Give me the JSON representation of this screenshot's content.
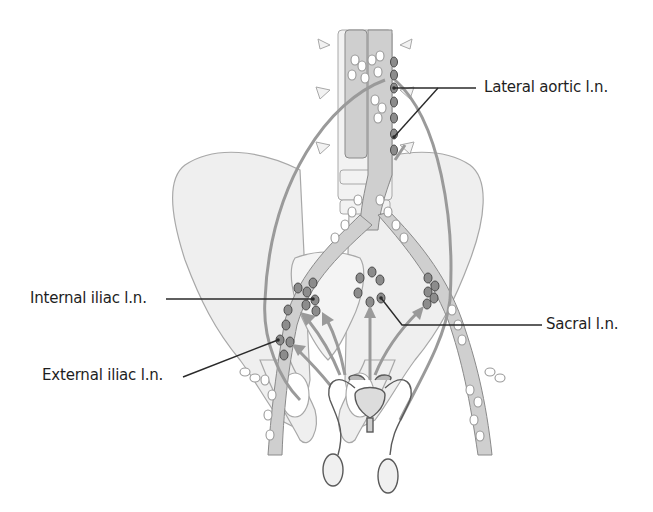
{
  "figure": {
    "colors": {
      "bone_fill": "#eeeeee",
      "bone_outline": "#a8a8a8",
      "vessel_fill": "#cfcfcf",
      "vessel_outline": "#8a8a8a",
      "node_open": "#ffffff",
      "node_labeled": "#8c8c8c",
      "node_outline": "#4a4a4a",
      "arrow": "#9a9a9a",
      "leader_line": "#2a2a2a",
      "text": "#1e1e1e"
    }
  },
  "labels": {
    "lateral_aortic": "Lateral aortic l.n.",
    "internal_iliac": "Internal iliac l.n.",
    "external_iliac": "External iliac l.n.",
    "sacral": "Sacral l.n."
  }
}
